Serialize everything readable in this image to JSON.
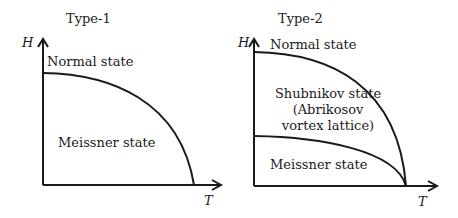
{
  "panels": [
    {
      "title": "Type-1",
      "y_axis_label": "H",
      "x_axis_label": "T",
      "regions": [
        "Normal state",
        "Meissner state"
      ]
    },
    {
      "title": "Type-2",
      "y_axis_label": "H",
      "x_axis_label": "T",
      "regions": [
        "Normal state",
        "Shubnikov state",
        "(Abrikosov",
        "vortex lattice)",
        "Meissner state"
      ]
    }
  ],
  "colors": {
    "line": "#1a1a1a",
    "background": "#ffffff"
  }
}
